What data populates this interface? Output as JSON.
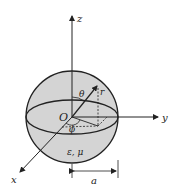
{
  "figure": {
    "type": "sphere-coordinate-diagram",
    "labels": {
      "z_axis": "z",
      "y_axis": "y",
      "x_axis": "x",
      "origin": "O",
      "theta": "θ",
      "phi": "ϕ",
      "radius": "r",
      "material": "ε, μ",
      "sphere_radius": "a"
    },
    "colors": {
      "sphere_fill": "#d4d4d4",
      "line": "#222222",
      "background": "#ffffff"
    }
  }
}
